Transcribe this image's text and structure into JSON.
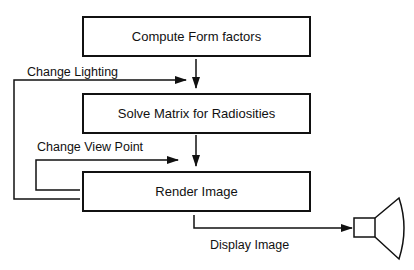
{
  "diagram": {
    "type": "flowchart",
    "nodes": [
      {
        "id": "compute",
        "label": "Compute Form factors"
      },
      {
        "id": "solve",
        "label": "Solve Matrix for Radiosities"
      },
      {
        "id": "render",
        "label": "Render Image"
      },
      {
        "id": "display",
        "label": "display-device-icon"
      }
    ],
    "edges": [
      {
        "from": "compute",
        "to": "solve",
        "label": ""
      },
      {
        "from": "render",
        "to": "solve",
        "label": "Change Lighting"
      },
      {
        "from": "render",
        "to": "render",
        "label": "Change View Point"
      },
      {
        "from": "render",
        "to": "display",
        "label": "Display Image"
      }
    ]
  },
  "labels": {
    "box1": "Compute Form factors",
    "box2": "Solve Matrix for Radiosities",
    "box3": "Render Image",
    "change_lighting": "Change Lighting",
    "change_view_point": "Change View Point",
    "display_image": "Display Image"
  },
  "colors": {
    "stroke": "#111111",
    "background": "#ffffff"
  }
}
